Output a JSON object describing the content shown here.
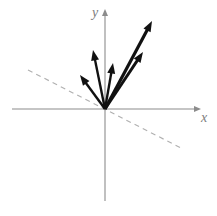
{
  "figure": {
    "width": 217,
    "height": 216,
    "background_color": "#ffffff"
  },
  "axes": {
    "x_label": "x",
    "y_label": "y",
    "label_color": "#7d7d7d",
    "axis_color": "#8c8c8c",
    "origin": {
      "x": 105,
      "y": 109
    },
    "x_axis": {
      "x_start": 12,
      "x_end": 197,
      "y": 109,
      "arrow_at": "end"
    },
    "y_axis": {
      "y_start": 13,
      "y_end": 201,
      "x": 105,
      "arrow_at": "start"
    }
  },
  "guide_line": {
    "name": "dashed-reference-line",
    "color": "#b0b0b0",
    "dash_pattern": "5 4.2",
    "x1": 28,
    "y1": 70,
    "x2": 181,
    "y2": 148
  },
  "chart_data": {
    "type": "scatter",
    "xlabel": "x",
    "ylabel": "y",
    "grid": false,
    "legend": null,
    "annotations": [
      "Five black arrows radiate from the origin into the upper half plane",
      "A gray dashed line of negative slope passes through the origin"
    ],
    "origin_px": {
      "x": 105,
      "y": 109
    },
    "series": [
      {
        "name": "vectors",
        "color": "#111111",
        "vectors": [
          {
            "id": "v1",
            "label": "vector-1",
            "tip_px": {
              "x": 80,
              "y": 75
            },
            "dx": -25,
            "dy": 34,
            "length": 42.2,
            "angle_deg": 126.3,
            "stroke_width": 2.4
          },
          {
            "id": "v2",
            "label": "vector-2",
            "tip_px": {
              "x": 93,
              "y": 50
            },
            "dx": -12,
            "dy": 59,
            "length": 60.2,
            "angle_deg": 101.5,
            "stroke_width": 2.4
          },
          {
            "id": "v3",
            "label": "vector-3",
            "tip_px": {
              "x": 113,
              "y": 63
            },
            "dx": 8,
            "dy": 46,
            "length": 46.7,
            "angle_deg": 80.1,
            "stroke_width": 2.4
          },
          {
            "id": "v4",
            "label": "vector-4",
            "tip_px": {
              "x": 143,
              "y": 52
            },
            "dx": 38,
            "dy": 57,
            "length": 68.5,
            "angle_deg": 56.3,
            "stroke_width": 2.9
          },
          {
            "id": "v5",
            "label": "vector-5",
            "tip_px": {
              "x": 152,
              "y": 21
            },
            "dx": 47,
            "dy": 88,
            "length": 99.8,
            "angle_deg": 61.9,
            "stroke_width": 3.2
          }
        ]
      }
    ]
  }
}
